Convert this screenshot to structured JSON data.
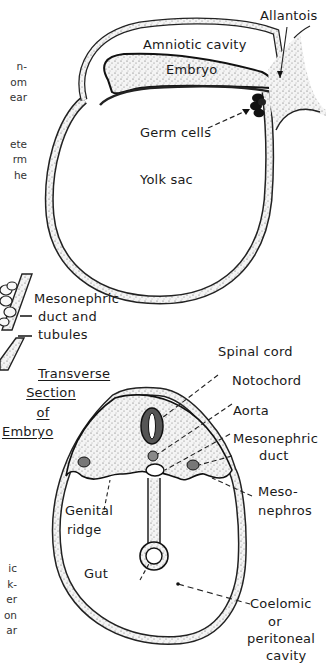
{
  "figure": {
    "top_diagram": {
      "labels": {
        "allantois": "Allantois",
        "amniotic_cavity": "Amniotic cavity",
        "embryo": "Embryo",
        "germ_cells": "Germ cells",
        "yolk_sac": "Yolk sac"
      }
    },
    "middle_diagram": {
      "labels": {
        "mesonephric_duct_line1": "Mesonephric",
        "mesonephric_duct_line2": "duct and",
        "mesonephric_duct_line3": "tubules"
      }
    },
    "bottom_diagram": {
      "title_lines": [
        "Transverse",
        "Section",
        "of",
        "Embryo"
      ],
      "labels": {
        "spinal_cord": "Spinal cord",
        "notochord": "Notochord",
        "aorta": "Aorta",
        "mesonephric_duct_line1": "Mesonephric",
        "mesonephric_duct_line2": "duct",
        "mesonephros_line1": "Meso-",
        "mesonephros_line2": "nephros",
        "genital_ridge_line1": "Genital",
        "genital_ridge_line2": "ridge",
        "gut": "Gut",
        "coelomic_line1": "Coelomic",
        "coelomic_line2": "or",
        "coelomic_line3": "peritoneal",
        "coelomic_line4": "cavity"
      }
    },
    "cropped_text_fragments": {
      "top": [
        "n-",
        "om",
        "ear",
        "",
        "",
        "ete",
        "rm",
        "he"
      ],
      "bottom": [
        "ic",
        "k-",
        "er",
        "on",
        "ar"
      ]
    }
  }
}
